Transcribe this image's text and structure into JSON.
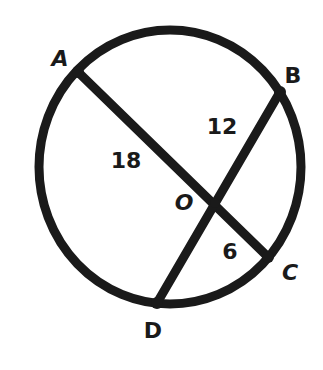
{
  "diagram": {
    "type": "circle-with-intersecting-chords",
    "stroke_color": "#1a1a1a",
    "background": "#ffffff",
    "circle": {
      "cx": 170,
      "cy": 167,
      "rx": 131,
      "ry": 137,
      "stroke_width": 9
    },
    "chords": [
      {
        "name": "AC",
        "from": "A",
        "to": "C"
      },
      {
        "name": "BD",
        "from": "B",
        "to": "D"
      }
    ],
    "points": {
      "A": {
        "label": "A",
        "x": 78,
        "y": 72,
        "label_x": 60,
        "label_y": 59
      },
      "B": {
        "label": "B",
        "x": 280,
        "y": 92,
        "label_x": 293,
        "label_y": 76
      },
      "C": {
        "label": "C",
        "x": 268,
        "y": 257,
        "label_x": 290,
        "label_y": 273
      },
      "D": {
        "label": "D",
        "x": 157,
        "y": 303,
        "label_x": 153,
        "label_y": 331
      },
      "O": {
        "label": "O",
        "x": 215,
        "y": 203,
        "label_x": 184,
        "label_y": 203
      }
    },
    "segment_labels": [
      {
        "segment": "AO",
        "value": "18",
        "x": 126,
        "y": 161
      },
      {
        "segment": "BO",
        "value": "12",
        "x": 222,
        "y": 127
      },
      {
        "segment": "OC",
        "value": "6",
        "x": 230,
        "y": 252
      }
    ]
  },
  "labels": {
    "A": "A",
    "B": "B",
    "C": "C",
    "D": "D",
    "O": "O",
    "AO": "18",
    "BO": "12",
    "OC": "6"
  }
}
